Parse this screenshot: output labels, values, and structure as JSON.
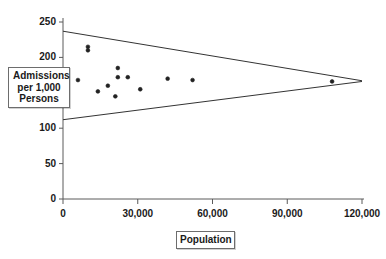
{
  "chart_data": {
    "type": "scatter",
    "title": "",
    "xlabel": "Population",
    "ylabel": "Admissions per 1,000 Persons",
    "xlim": [
      0,
      120000
    ],
    "ylim": [
      0,
      250
    ],
    "grid": false,
    "legend": "none",
    "x_ticks": [
      {
        "value": 0,
        "label": "0"
      },
      {
        "value": 30000,
        "label": "30,000"
      },
      {
        "value": 60000,
        "label": "60,000"
      },
      {
        "value": 90000,
        "label": "90,000"
      },
      {
        "value": 120000,
        "label": "120,000"
      }
    ],
    "y_ticks": [
      {
        "value": 0,
        "label": "0"
      },
      {
        "value": 50,
        "label": "50"
      },
      {
        "value": 100,
        "label": "100"
      },
      {
        "value": 150,
        "label": ""
      },
      {
        "value": 200,
        "label": "200"
      },
      {
        "value": 250,
        "label": "250"
      }
    ],
    "points": [
      {
        "x": 10000,
        "y": 215
      },
      {
        "x": 10000,
        "y": 210
      },
      {
        "x": 6000,
        "y": 168
      },
      {
        "x": 14000,
        "y": 152
      },
      {
        "x": 18000,
        "y": 160
      },
      {
        "x": 22000,
        "y": 185
      },
      {
        "x": 22000,
        "y": 172
      },
      {
        "x": 21000,
        "y": 145
      },
      {
        "x": 26000,
        "y": 172
      },
      {
        "x": 31000,
        "y": 155
      },
      {
        "x": 42000,
        "y": 170
      },
      {
        "x": 52000,
        "y": 168
      },
      {
        "x": 108000,
        "y": 166
      }
    ],
    "control_limits": {
      "upper": {
        "x_start": 0,
        "y_start": 237,
        "x_end": 120000,
        "y_end": 167
      },
      "lower": {
        "x_start": 0,
        "y_start": 112,
        "x_end": 120000,
        "y_end": 166
      }
    },
    "colors": {
      "axis": "#5a5a5a",
      "marker": "#222222",
      "limit_line": "#333333",
      "background": "#ffffff",
      "text": "#1a1a1a"
    }
  }
}
